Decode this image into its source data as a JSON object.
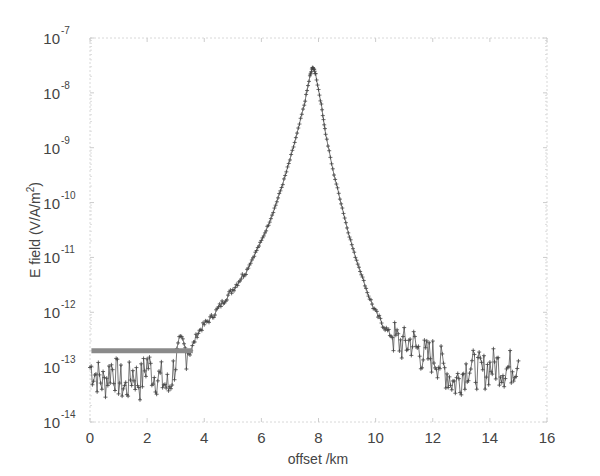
{
  "chart_data": {
    "type": "line",
    "title": "",
    "xlabel": "offset  /km",
    "ylabel": "E field (V/A/m",
    "ylabel_sup": "2",
    "ylabel_close": ")",
    "xlim": [
      0,
      16
    ],
    "ylim": [
      1e-14,
      1e-07
    ],
    "yscale": "log",
    "grid": false,
    "legend": null,
    "x_ticks": [
      0,
      2,
      4,
      6,
      8,
      10,
      12,
      14,
      16
    ],
    "y_ticks": [
      {
        "base": "10",
        "exp": "-7"
      },
      {
        "base": "10",
        "exp": "-8"
      },
      {
        "base": "10",
        "exp": "-9"
      },
      {
        "base": "10",
        "exp": "-10"
      },
      {
        "base": "10",
        "exp": "-11"
      },
      {
        "base": "10",
        "exp": "-12"
      },
      {
        "base": "10",
        "exp": "-13"
      },
      {
        "base": "10",
        "exp": "-14"
      }
    ],
    "series": [
      {
        "name": "measured E field",
        "style": "line with + markers",
        "color": "#555555",
        "x": [
          0.0,
          0.25,
          0.5,
          0.75,
          1.0,
          1.25,
          1.5,
          1.75,
          2.0,
          2.25,
          2.5,
          2.75,
          3.0,
          3.25,
          3.5,
          3.75,
          4.0,
          4.25,
          4.5,
          4.75,
          5.0,
          5.25,
          5.5,
          5.75,
          6.0,
          6.25,
          6.5,
          6.75,
          7.0,
          7.25,
          7.5,
          7.7,
          7.8,
          7.9,
          8.1,
          8.25,
          8.5,
          8.75,
          9.0,
          9.25,
          9.5,
          9.75,
          10.0,
          10.25,
          10.5,
          10.75,
          11.0,
          11.25,
          11.5,
          11.75,
          12.0,
          12.25,
          12.5,
          12.75,
          13.0,
          13.25,
          13.5,
          13.75,
          14.0,
          14.25,
          14.5,
          14.75,
          15.0
        ],
        "y": [
          1e-13,
          7e-14,
          5e-14,
          1e-13,
          6e-14,
          4e-14,
          8e-14,
          5e-14,
          1.2e-13,
          7e-14,
          6e-14,
          4e-14,
          1.3e-13,
          2.2e-13,
          1.8e-13,
          4e-13,
          6e-13,
          8e-13,
          1.2e-12,
          1.8e-12,
          2.6e-12,
          4e-12,
          6e-12,
          1.1e-11,
          2e-11,
          4e-11,
          9e-11,
          2.2e-10,
          6e-10,
          1.8e-09,
          6e-09,
          2e-08,
          3e-08,
          2.2e-08,
          6e-09,
          1.8e-09,
          4e-10,
          1.2e-10,
          3.5e-11,
          1.2e-11,
          5e-12,
          2e-12,
          1e-12,
          6e-13,
          4e-13,
          3e-13,
          2.5e-13,
          3e-13,
          2e-13,
          1.5e-13,
          1.6e-13,
          1.2e-13,
          8e-14,
          5e-14,
          7e-14,
          1.1e-13,
          9e-14,
          8e-14,
          1e-13,
          1.1e-13,
          9e-14,
          1e-13,
          1.3e-13
        ]
      },
      {
        "name": "noise floor",
        "style": "thick grey bar",
        "color": "#8a8a8a",
        "x": [
          0.05,
          3.6
        ],
        "y": [
          2e-13,
          2e-13
        ]
      }
    ],
    "annotations": []
  }
}
